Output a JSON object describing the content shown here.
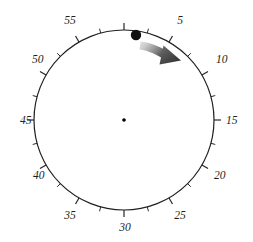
{
  "figure": {
    "type": "clock-dial-diagram",
    "title": "",
    "background_color": "#ffffff",
    "width": 253,
    "height": 242
  },
  "dial": {
    "center_x": 124,
    "center_y": 120,
    "radius": 90,
    "rim_color": "#231f20",
    "rim_width": 1.2,
    "units": "minutes",
    "full_scale": 60,
    "major_tick_interval": 5,
    "minor_tick_interval": 2.5,
    "major_tick_length": 7,
    "minor_tick_length": 4.5,
    "tick_color": "#231f20"
  },
  "labels": [
    {
      "value": 5,
      "text": "5",
      "x": 180,
      "y": 24,
      "anchor": "middle"
    },
    {
      "value": 10,
      "text": "10",
      "x": 216,
      "y": 63,
      "anchor": "start"
    },
    {
      "value": 15,
      "text": "15",
      "x": 226,
      "y": 124,
      "anchor": "start"
    },
    {
      "value": 20,
      "text": "20",
      "x": 214,
      "y": 179,
      "anchor": "start"
    },
    {
      "value": 25,
      "text": "25",
      "x": 180,
      "y": 219,
      "anchor": "middle"
    },
    {
      "value": 30,
      "text": "30",
      "x": 125,
      "y": 231,
      "anchor": "middle"
    },
    {
      "value": 35,
      "text": "35",
      "x": 70,
      "y": 219,
      "anchor": "middle"
    },
    {
      "value": 40,
      "text": "40",
      "x": 33,
      "y": 179,
      "anchor": "start"
    },
    {
      "value": 45,
      "text": "45",
      "x": 20,
      "y": 124,
      "anchor": "start"
    },
    {
      "value": 50,
      "text": "50",
      "x": 32,
      "y": 63,
      "anchor": "start"
    },
    {
      "value": 55,
      "text": "55",
      "x": 70,
      "y": 24,
      "anchor": "middle"
    }
  ],
  "center_dot": {
    "x": 124,
    "y": 120,
    "radius": 1.8,
    "color": "#000000"
  },
  "marker_dot": {
    "label": "position-marker",
    "minute_value": 2,
    "x": 136,
    "y": 35,
    "radius": 5.2,
    "color": "#111111"
  },
  "arrow": {
    "label": "clockwise-sweep-arrow",
    "direction": "clockwise",
    "from_minute": 2.5,
    "to_minute": 8.5,
    "color_start": "#d9d9d9",
    "color_end": "#4a4a4a",
    "head_x": 179,
    "head_y": 58
  },
  "chart_data": {
    "type": "pie",
    "xlabel": "",
    "ylabel": "",
    "categories": [
      "5",
      "10",
      "15",
      "20",
      "25",
      "30",
      "35",
      "40",
      "45",
      "50",
      "55",
      "60"
    ],
    "values": [
      5,
      10,
      15,
      20,
      25,
      30,
      35,
      40,
      45,
      50,
      55,
      60
    ],
    "annotations": [
      {
        "name": "position-marker",
        "minute": 2
      },
      {
        "name": "sweep-arrow",
        "from_minute": 2.5,
        "to_minute": 8.5,
        "direction": "clockwise"
      }
    ]
  }
}
